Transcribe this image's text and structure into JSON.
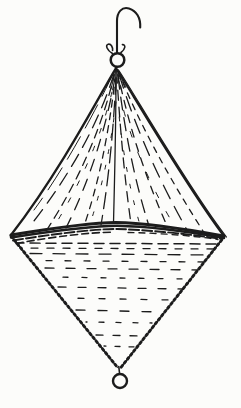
{
  "page": {
    "width_px": 241,
    "height_px": 408
  },
  "illustration": {
    "alt": "Hand-drawn ink sketch of a canvas diamond shape: an upper cone and a lower inverted cone joined base to base at a dark stitched seam, gathered at the top into a metal ring hung from a J-shaped hook with a small swivel fitting, and finished with a small ring at the bottom point",
    "ink_color": "#1c1c1c",
    "paper_color": "#fcfcfa",
    "parts": {
      "hook": "J-shaped hanging hook",
      "swivel": "wire swivel fitting above the top ring",
      "top_ring": "top suspension ring",
      "upper_cone": "upper canvas cone with radiating fold hatching",
      "center_seam_line": "vertical center seam of upper cone",
      "mid_seam": "dark stitched seam at the widest point",
      "lower_cone": "lower inverted cone with horizontal sketch shading",
      "beaded_edges": "beaded stitched edges of the lower cone",
      "bottom_ring": "small bottom ring at the lower point"
    }
  }
}
